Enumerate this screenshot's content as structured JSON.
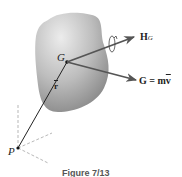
{
  "diagram": {
    "labels": {
      "G_point": "G",
      "r_vector": "r",
      "P_point": "P",
      "HG_main": "H",
      "HG_sub": "G",
      "linear_momentum": "G = m",
      "linear_momentum_v": "v"
    },
    "caption": "Figure 7/13",
    "colors": {
      "body_light": "#e6e6e6",
      "body_dark": "#8e8e8e",
      "arrow": "#555555",
      "line": "#222222",
      "dashed": "#999999"
    }
  }
}
